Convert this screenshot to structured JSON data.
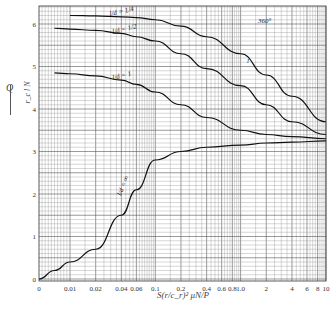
{
  "chart_data": {
    "type": "line",
    "title": "",
    "annotation": "360°",
    "xlabel": "S(r/c_r)^2 μN/P",
    "ylabel": "Q / r_c l N",
    "xscale": "log (with 0 at origin)",
    "x_tick_labels": [
      "0",
      "0.01",
      "0.02",
      "0.04",
      "0.06",
      "0.1",
      "0.2",
      "0.4",
      "0.6",
      "0.8",
      "1.0",
      "2",
      "4",
      "6",
      "8",
      "10"
    ],
    "y_tick_labels": [
      "0",
      "1",
      "2",
      "3",
      "4",
      "5",
      "6"
    ],
    "ylim": [
      0,
      6.5
    ],
    "xlim": [
      0,
      10
    ],
    "grid": true,
    "x": [
      0.005,
      0.01,
      0.02,
      0.04,
      0.06,
      0.1,
      0.2,
      0.4,
      1.0,
      2,
      4,
      10
    ],
    "series": [
      {
        "name": "l/d = 1/4",
        "values": [
          6.2,
          6.2,
          6.19,
          6.17,
          6.15,
          6.1,
          5.95,
          5.7,
          5.3,
          4.8,
          4.3,
          3.7
        ]
      },
      {
        "name": "l/d = 1/2",
        "values": [
          5.9,
          5.88,
          5.85,
          5.78,
          5.7,
          5.6,
          5.3,
          4.95,
          4.55,
          4.1,
          3.7,
          3.4
        ]
      },
      {
        "name": "l/d = 1",
        "values": [
          4.85,
          4.83,
          4.78,
          4.68,
          4.58,
          4.4,
          4.1,
          3.8,
          3.5,
          3.4,
          3.35,
          3.3
        ]
      },
      {
        "name": "l/d = ∞",
        "values": [
          0.2,
          0.4,
          0.7,
          1.5,
          2.1,
          2.8,
          3.0,
          3.1,
          3.15,
          3.2,
          3.22,
          3.25
        ]
      }
    ]
  },
  "labels": {
    "y_num": "Q",
    "y_den": "r_c l N",
    "x_axis": "S(r/c_r)² μN/P",
    "annotation": "360°",
    "curve_1": "l/d = 1/4",
    "curve_2": "l/d = 1/2",
    "curve_3": "l/d = 1",
    "curve_4": "l/d = ∞",
    "curve_end": "l"
  }
}
